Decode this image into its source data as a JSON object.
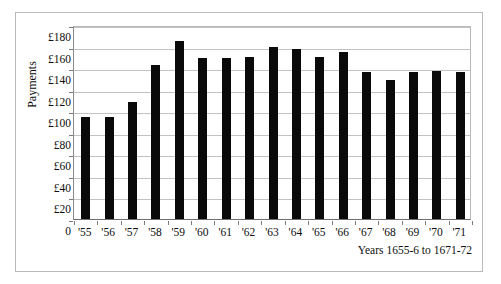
{
  "chart_data": {
    "type": "bar",
    "title": "",
    "subtitle": "",
    "xlabel": "Years 1655-6 to 1671-72",
    "ylabel": "Payments",
    "categories": [
      "'55",
      "'56",
      "'57",
      "'58",
      "'59",
      "'60",
      "'61",
      "'62",
      "'63",
      "'64",
      "'65",
      "'66",
      "'67",
      "'68",
      "'69",
      "'70",
      "'71"
    ],
    "values": [
      95,
      95,
      109,
      143,
      165,
      149,
      149,
      150,
      160,
      158,
      150,
      155,
      136,
      129,
      136,
      137,
      136
    ],
    "series": [
      {
        "name": "Payments",
        "values": [
          95,
          95,
          109,
          143,
          165,
          149,
          149,
          150,
          160,
          158,
          150,
          155,
          136,
          129,
          136,
          137,
          136
        ]
      }
    ],
    "ylim": [
      0,
      180
    ],
    "ytick_values": [
      0,
      20,
      40,
      60,
      80,
      100,
      120,
      140,
      160,
      180
    ],
    "ytick_labels": [
      "0",
      "£20",
      "£40",
      "£60",
      "£80",
      "£100",
      "£120",
      "£140",
      "£160",
      "£180"
    ],
    "grid": true,
    "grid_axis": "y",
    "legend": false,
    "legend_position": "none",
    "bar_color": "#0a0a0a",
    "plot_background": "#ffffff",
    "gridline_color": "#c2c2c2",
    "frame_color": "#b9b9b9",
    "annotations": []
  }
}
